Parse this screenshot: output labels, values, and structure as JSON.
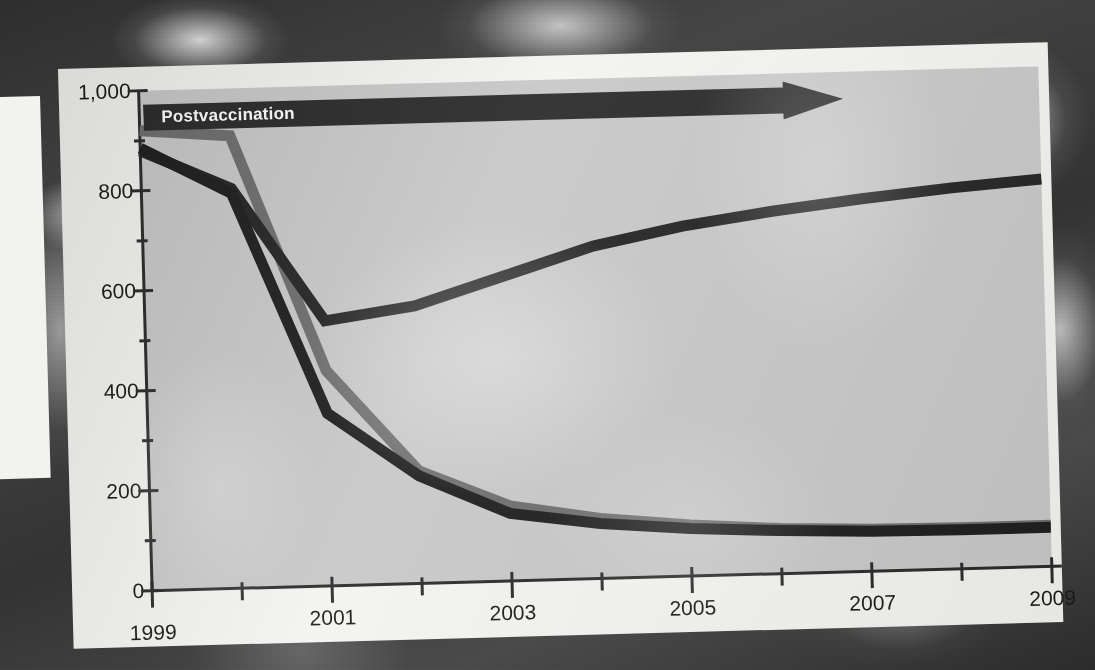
{
  "figure": {
    "annotation": {
      "label": "Postvaccination",
      "icon": "right-arrow-icon",
      "color": "#2b2b2b"
    },
    "colors": {
      "plot_background": "#c8c8c8",
      "page_background": "#f3f3f0",
      "axis": "#2b2b2b",
      "series_dark": "#2a2a2a",
      "series_black": "#1f1f1f",
      "series_gray": "#6e6e6e"
    }
  },
  "chart_data": {
    "type": "line",
    "title": "",
    "subtitle": "",
    "xlabel": "",
    "ylabel": "",
    "x": [
      1999,
      2000,
      2001,
      2002,
      2003,
      2004,
      2005,
      2006,
      2007,
      2008,
      2009
    ],
    "xtick_labels": [
      "1999",
      "2001",
      "2003",
      "2005",
      "2007",
      "2009"
    ],
    "xtick_values": [
      1999,
      2001,
      2003,
      2005,
      2007,
      2009
    ],
    "xlim": [
      1999,
      2009
    ],
    "ytick_labels": [
      "0",
      "200",
      "400",
      "600",
      "800",
      "1,000"
    ],
    "ytick_values": [
      0,
      200,
      400,
      600,
      800,
      1000
    ],
    "yminor_values": [
      100,
      300,
      500,
      700,
      900
    ],
    "ylim": [
      0,
      1000
    ],
    "grid": false,
    "legend": "none",
    "series": [
      {
        "name": "series-upper-dark",
        "color": "#262626",
        "values": [
          880,
          800,
          530,
          555,
          610,
          665,
          700,
          725,
          745,
          762,
          775
        ]
      },
      {
        "name": "series-declining-black",
        "color": "#1f1f1f",
        "values": [
          885,
          790,
          345,
          215,
          135,
          110,
          95,
          86,
          80,
          78,
          78
        ]
      },
      {
        "name": "series-declining-gray",
        "color": "#6e6e6e",
        "values": [
          920,
          905,
          430,
          225,
          150,
          120,
          102,
          90,
          84,
          82,
          82
        ]
      }
    ],
    "annotations": [
      {
        "text": "Postvaccination",
        "type": "arrow-band",
        "x_start": 1999,
        "x_end": 2008.1,
        "y": 1000
      }
    ]
  }
}
